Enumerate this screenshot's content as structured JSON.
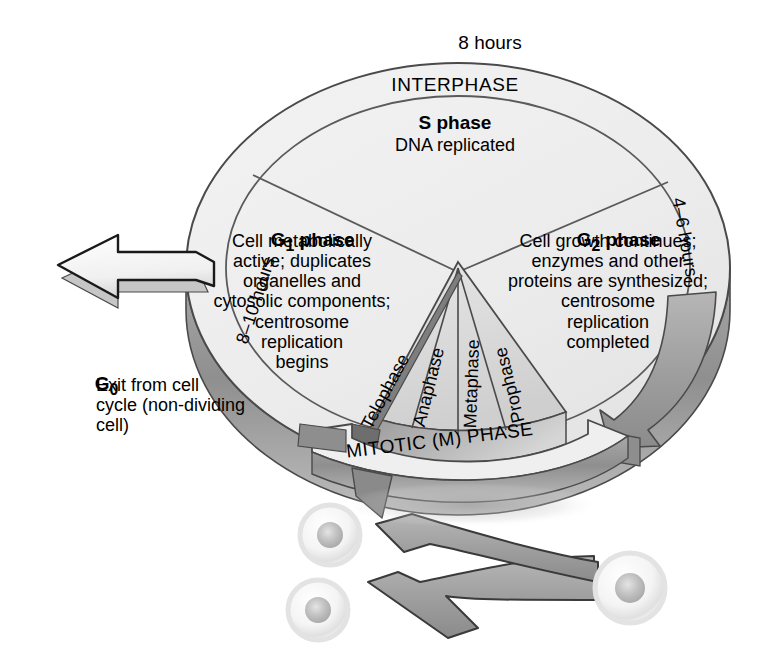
{
  "labels": {
    "hours_top": "8 hours",
    "interphase": "INTERPHASE",
    "hours_left": "8–10 hours",
    "hours_right": "4–6 hours",
    "mitotic_phase": "MITOTIC (M) PHASE"
  },
  "phases": [
    {
      "id": "s-phase",
      "name": "S phase",
      "name_base": "S",
      "name_sub": "",
      "description": "DNA replicated",
      "duration": "8 hours"
    },
    {
      "id": "g1-phase",
      "name": "G1 phase",
      "name_base": "G",
      "name_sub": "1",
      "description": "Cell metabolically\nactive; duplicates\norganelles and\ncytosolic components;\ncentrosome\nreplication\nbegins",
      "duration": "8–10 hours"
    },
    {
      "id": "g2-phase",
      "name": "G2 phase",
      "name_base": "G",
      "name_sub": "2",
      "description": "Cell growth continues;\nenzymes and other\nproteins are synthesized;\ncentrosome\nreplication\ncompleted",
      "duration": "4–6 hours"
    },
    {
      "id": "g0-phase",
      "name": "G0",
      "name_base": "G",
      "name_sub": "0",
      "description": "Exit from cell\ncycle (non-dividing\ncell)",
      "duration": ""
    }
  ],
  "mitotic_stages": [
    {
      "id": "telophase",
      "label": "Telophase"
    },
    {
      "id": "anaphase",
      "label": "Anaphase"
    },
    {
      "id": "metaphase",
      "label": "Metaphase"
    },
    {
      "id": "prophase",
      "label": "Prophase"
    }
  ],
  "cells": [
    {
      "id": "parent-cell",
      "role": "parent"
    },
    {
      "id": "daughter-cell-1",
      "role": "daughter"
    },
    {
      "id": "daughter-cell-2",
      "role": "daughter"
    }
  ],
  "colors": {
    "disk_face": "#ededed",
    "disk_ring": "#e8e8e8",
    "disk_side_dark": "#8c8c8c",
    "disk_side_light": "#c9c9c9",
    "mitotic_wedge": "#dcdcdc",
    "arrow_gray": "#a0a0a0",
    "arrow_white": "#f2f2f2",
    "outline": "#4a4a4a",
    "text": "#000000",
    "cell_membrane": "#dcdcdc",
    "cell_nucleus": "#b8b8b8"
  }
}
